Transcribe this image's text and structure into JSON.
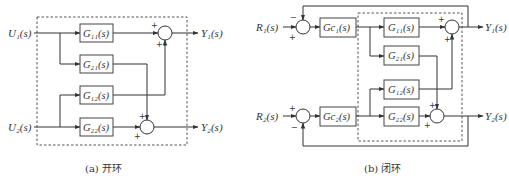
{
  "figure": {
    "open_loop": {
      "caption": "(a) 开环",
      "inputs": [
        "U₁(s)",
        "U₂(s)"
      ],
      "outputs": [
        "Y₁(s)",
        "Y₂(s)"
      ],
      "blocks": [
        "G₁₁(s)",
        "G₂₁(s)",
        "G₁₂(s)",
        "G₂₂(s)"
      ],
      "sum1_signs": [
        "+",
        "+"
      ],
      "sum2_signs": [
        "+",
        "+"
      ]
    },
    "closed_loop": {
      "caption": "(b) 闭环",
      "inputs": [
        "R₁(s)",
        "R₂(s)"
      ],
      "outputs": [
        "Y₁(s)",
        "Y₂(s)"
      ],
      "controllers": [
        "Gc₁(s)",
        "Gc₂(s)"
      ],
      "blocks": [
        "G₁₁(s)",
        "G₂₁(s)",
        "G₁₂(s)",
        "G₂₂(s)"
      ],
      "err1_signs": [
        "−",
        "+"
      ],
      "err2_signs": [
        "+",
        "−"
      ],
      "sum1_signs": [
        "+",
        "+"
      ],
      "sum2_signs": [
        "+",
        "+"
      ]
    }
  }
}
